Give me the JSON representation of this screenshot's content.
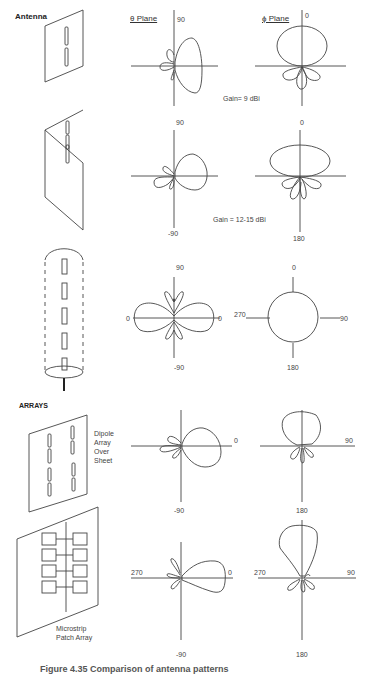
{
  "figure": {
    "section_labels": {
      "antenna": "Antenna",
      "arrays": "ARRAYS"
    },
    "plane_headers": {
      "theta": "θ Plane",
      "phi": "ϕ Plane"
    },
    "rows": [
      {
        "name": "dipole-pair-over-sheet",
        "theta": {
          "top": "90",
          "bottom": "",
          "left": "",
          "right": ""
        },
        "phi": {
          "top": "0",
          "bottom": "",
          "left": "",
          "right": ""
        },
        "gain": "Gain= 9 dBi"
      },
      {
        "name": "stacked-dipoles-corner-reflector",
        "theta": {
          "top": "90",
          "bottom": "-90",
          "left": "",
          "right": ""
        },
        "phi": {
          "top": "0",
          "bottom": "180",
          "left": "",
          "right": ""
        },
        "gain": "Gain = 12-15 dBi"
      },
      {
        "name": "collinear-array-radome",
        "theta": {
          "top": "90",
          "bottom": "-90",
          "left": "0",
          "right": "0"
        },
        "phi": {
          "top": "0",
          "bottom": "180",
          "left": "270",
          "right": "90"
        },
        "gain": ""
      },
      {
        "name": "dipole-array-over-sheet",
        "description": [
          "Dipole",
          "Array",
          "Over",
          "Sheet"
        ],
        "theta": {
          "top": "",
          "bottom": "-90",
          "left": "",
          "right": "0"
        },
        "phi": {
          "top": "",
          "bottom": "180",
          "left": "",
          "right": "90"
        },
        "gain": ""
      },
      {
        "name": "microstrip-patch-array",
        "description": [
          "Microstrip",
          "Patch Array"
        ],
        "theta": {
          "top": "",
          "bottom": "-90",
          "left": "270",
          "right": "0"
        },
        "phi": {
          "top": "",
          "bottom": "180",
          "left": "270",
          "right": "90"
        },
        "gain": ""
      }
    ],
    "caption": "Figure 4.35   Comparison of antenna patterns"
  }
}
